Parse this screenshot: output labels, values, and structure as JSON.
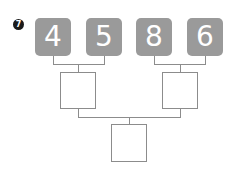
{
  "problem": {
    "number": "7",
    "top_numbers": [
      "4",
      "5",
      "8",
      "6"
    ],
    "middle_boxes": [
      "",
      ""
    ],
    "bottom_box": "",
    "colors": {
      "tile": "#9a9a9a",
      "tile_text": "#ffffff",
      "line": "#8c8c8c",
      "badge": "#1a1a1a"
    }
  }
}
